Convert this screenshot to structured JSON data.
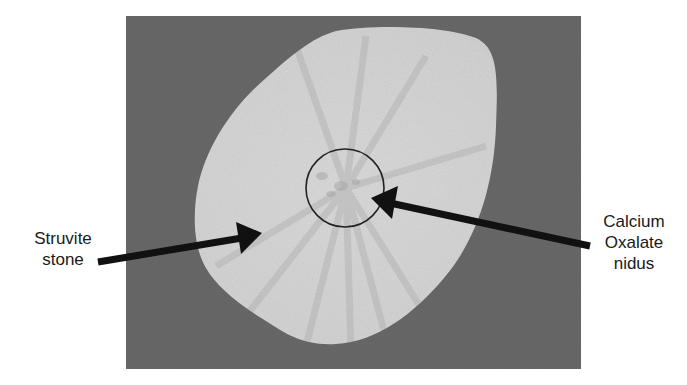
{
  "figure": {
    "colors": {
      "background": "#ffffff",
      "photo_background": "#6e6e6e",
      "stone_fill": "#d4d4d4",
      "stone_rays": "#bdbdbd",
      "annotation": "#111111",
      "label_text": "#1a1a1a"
    },
    "annotations": [
      {
        "id": "struvite",
        "label_lines": [
          "Struvite",
          "stone"
        ],
        "points_to": "outer stone body"
      },
      {
        "id": "oxalate",
        "label_lines": [
          "Calcium",
          "Oxalate",
          "nidus"
        ],
        "points_to": "circled central nidus"
      }
    ]
  }
}
